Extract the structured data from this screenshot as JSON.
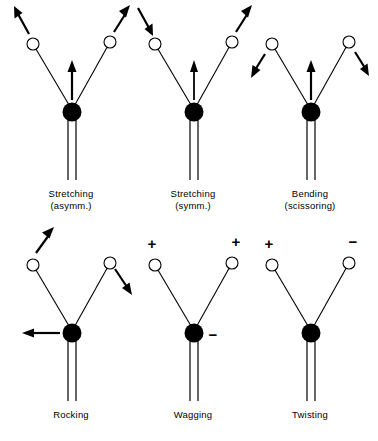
{
  "figure": {
    "colors": {
      "ink": "#000000",
      "background": "#ffffff",
      "atom_fill": "#000000",
      "hydrogen_fill": "#ffffff"
    },
    "panels": [
      {
        "id": "stretching-asymmetric",
        "label_line1": "Stretching",
        "label_line2": "(asymm.)",
        "center_atom": "filled-circle",
        "side_atoms": [
          "open-circle",
          "open-circle"
        ],
        "stem": "double-line",
        "center_arrow": "up",
        "left_arrow": "up-left",
        "right_arrow": "up-right",
        "signs": []
      },
      {
        "id": "stretching-symmetric",
        "label_line1": "Stretching",
        "label_line2": "(symm.)",
        "center_atom": "filled-circle",
        "side_atoms": [
          "open-circle",
          "open-circle"
        ],
        "stem": "double-line",
        "center_arrow": "up",
        "left_arrow": "down-right",
        "right_arrow": "up-right",
        "signs": []
      },
      {
        "id": "bending-scissoring",
        "label_line1": "Bending",
        "label_line2": "(scissoring)",
        "center_atom": "filled-circle",
        "side_atoms": [
          "open-circle",
          "open-circle"
        ],
        "stem": "double-line",
        "center_arrow": "up",
        "left_arrow": "down-left",
        "right_arrow": "down-right",
        "signs": []
      },
      {
        "id": "rocking",
        "label_line1": "Rocking",
        "label_line2": "",
        "center_atom": "filled-circle",
        "side_atoms": [
          "open-circle",
          "open-circle"
        ],
        "stem": "double-line",
        "center_arrow": "left",
        "left_arrow": "up-right",
        "right_arrow": "down-right",
        "signs": []
      },
      {
        "id": "wagging",
        "label_line1": "Wagging",
        "label_line2": "",
        "center_atom": "filled-circle",
        "side_atoms": [
          "open-circle",
          "open-circle"
        ],
        "stem": "double-line",
        "center_arrow": "none",
        "left_arrow": "none",
        "right_arrow": "none",
        "signs": [
          {
            "text": "+",
            "position": "above-left-atom"
          },
          {
            "text": "+",
            "position": "above-right-atom"
          },
          {
            "text": "−",
            "position": "right-of-center-atom"
          }
        ]
      },
      {
        "id": "twisting",
        "label_line1": "Twisting",
        "label_line2": "",
        "center_atom": "filled-circle",
        "side_atoms": [
          "open-circle",
          "open-circle"
        ],
        "stem": "double-line",
        "center_arrow": "none",
        "left_arrow": "none",
        "right_arrow": "none",
        "signs": [
          {
            "text": "+",
            "position": "above-left-atom"
          },
          {
            "text": "−",
            "position": "above-right-atom"
          }
        ]
      }
    ]
  }
}
